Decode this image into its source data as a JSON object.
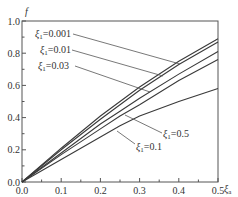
{
  "chart_data": {
    "type": "line",
    "title": "",
    "xlabel": "ξa",
    "xlabel_main": "ξ",
    "xlabel_sub": "a",
    "ylabel": "f",
    "xlim": [
      0.0,
      0.5
    ],
    "ylim": [
      0.0,
      1.0
    ],
    "x_ticks": [
      "0.0",
      "0.1",
      "0.2",
      "0.3",
      "0.4",
      "0.5"
    ],
    "y_ticks": [
      "0.0",
      "0.2",
      "0.4",
      "0.6",
      "0.8",
      "1.0"
    ],
    "grid": false,
    "legend_position": "inline annotations with leader lines",
    "x": [
      0.0,
      0.1,
      0.2,
      0.25,
      0.3,
      0.4,
      0.5
    ],
    "series": [
      {
        "name": "ξ1=0.001",
        "label_main": "ξ",
        "label_sub": "1",
        "label_value": "=0.001",
        "values": [
          0.0,
          0.21,
          0.41,
          0.5,
          0.59,
          0.75,
          0.89
        ]
      },
      {
        "name": "ξ1=0.01",
        "label_main": "ξ",
        "label_sub": "1",
        "label_value": "=0.01",
        "values": [
          0.0,
          0.2,
          0.39,
          0.48,
          0.57,
          0.73,
          0.87
        ]
      },
      {
        "name": "ξ1=0.03",
        "label_main": "ξ",
        "label_sub": "1",
        "label_value": "=0.03",
        "values": [
          0.0,
          0.18,
          0.36,
          0.44,
          0.52,
          0.67,
          0.81
        ]
      },
      {
        "name": "ξ1=0.5",
        "label_main": "ξ",
        "label_sub": "1",
        "label_value": "=0.5",
        "values": [
          0.0,
          0.17,
          0.33,
          0.41,
          0.48,
          0.63,
          0.76
        ]
      },
      {
        "name": "ξ1=0.1",
        "label_main": "ξ",
        "label_sub": "1",
        "label_value": "=0.1",
        "values": [
          0.0,
          0.14,
          0.28,
          0.35,
          0.41,
          0.5,
          0.58
        ]
      }
    ]
  }
}
